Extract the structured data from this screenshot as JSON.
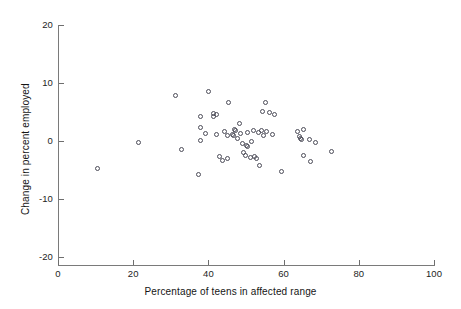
{
  "chart_data": {
    "type": "scatter",
    "title": "",
    "xlabel": "Percentage of teens in affected range",
    "ylabel": "Change in percent employed",
    "xlim": [
      0,
      100
    ],
    "ylim": [
      -20,
      20
    ],
    "xticks": [
      0,
      20,
      40,
      60,
      80,
      100
    ],
    "yticks": [
      20,
      10,
      0,
      -10,
      -20
    ],
    "xticklabels": [
      "0",
      "20",
      "40",
      "60",
      "80",
      "100"
    ],
    "yticklabels": [
      "20",
      "10",
      "0",
      "-10",
      "-20"
    ],
    "grid": false,
    "legend": null,
    "marker": "open-circle",
    "marker_color": "#4c4c58",
    "points": [
      {
        "x": 10.6,
        "y": -4.9
      },
      {
        "x": 21.5,
        "y": -0.3
      },
      {
        "x": 31.4,
        "y": 7.7
      },
      {
        "x": 33.0,
        "y": -1.6
      },
      {
        "x": 37.5,
        "y": -5.9
      },
      {
        "x": 37.9,
        "y": 4.1
      },
      {
        "x": 38.0,
        "y": 2.2
      },
      {
        "x": 38.1,
        "y": 0.0
      },
      {
        "x": 39.3,
        "y": 1.2
      },
      {
        "x": 40.2,
        "y": 8.5
      },
      {
        "x": 41.4,
        "y": 4.6
      },
      {
        "x": 41.6,
        "y": 4.1
      },
      {
        "x": 42.3,
        "y": 4.5
      },
      {
        "x": 42.4,
        "y": 1.0
      },
      {
        "x": 43.1,
        "y": -2.8
      },
      {
        "x": 43.9,
        "y": -3.4
      },
      {
        "x": 44.3,
        "y": 1.5
      },
      {
        "x": 45.1,
        "y": -3.1
      },
      {
        "x": 45.3,
        "y": 0.9
      },
      {
        "x": 45.6,
        "y": 6.6
      },
      {
        "x": 46.5,
        "y": 1.0
      },
      {
        "x": 46.8,
        "y": 0.8
      },
      {
        "x": 47.2,
        "y": 1.9
      },
      {
        "x": 47.4,
        "y": 1.8
      },
      {
        "x": 47.9,
        "y": 0.3
      },
      {
        "x": 48.4,
        "y": 3.0
      },
      {
        "x": 48.6,
        "y": 1.2
      },
      {
        "x": 49.2,
        "y": -0.6
      },
      {
        "x": 49.6,
        "y": -2.1
      },
      {
        "x": 49.9,
        "y": -2.6
      },
      {
        "x": 50.2,
        "y": -0.9
      },
      {
        "x": 50.4,
        "y": 1.4
      },
      {
        "x": 50.6,
        "y": -1.0
      },
      {
        "x": 51.2,
        "y": -2.9
      },
      {
        "x": 51.6,
        "y": -0.2
      },
      {
        "x": 52.0,
        "y": 1.7
      },
      {
        "x": 52.3,
        "y": -2.7
      },
      {
        "x": 52.9,
        "y": -3.1
      },
      {
        "x": 53.4,
        "y": 1.3
      },
      {
        "x": 53.8,
        "y": -4.3
      },
      {
        "x": 54.3,
        "y": 1.7
      },
      {
        "x": 54.6,
        "y": 5.0
      },
      {
        "x": 54.8,
        "y": 0.9
      },
      {
        "x": 55.2,
        "y": 6.6
      },
      {
        "x": 55.6,
        "y": 1.6
      },
      {
        "x": 56.5,
        "y": 4.9
      },
      {
        "x": 57.1,
        "y": 1.0
      },
      {
        "x": 57.6,
        "y": 4.4
      },
      {
        "x": 59.6,
        "y": -5.4
      },
      {
        "x": 63.9,
        "y": 1.6
      },
      {
        "x": 64.3,
        "y": 0.7
      },
      {
        "x": 64.6,
        "y": 0.3
      },
      {
        "x": 64.9,
        "y": 0.1
      },
      {
        "x": 65.3,
        "y": 1.9
      },
      {
        "x": 65.5,
        "y": -2.6
      },
      {
        "x": 66.9,
        "y": 0.2
      },
      {
        "x": 67.2,
        "y": -3.7
      },
      {
        "x": 68.6,
        "y": -0.4
      },
      {
        "x": 73.0,
        "y": -1.9
      }
    ]
  }
}
